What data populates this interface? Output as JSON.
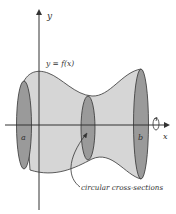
{
  "diagram": {
    "labels": {
      "y_axis": "y",
      "x_axis": "x",
      "curve": "y = f(x)",
      "a": "a",
      "b": "b",
      "annotation": "circular cross-sections"
    },
    "colors": {
      "solid_fill": "#d6d6d6",
      "cross_section_fill": "#9a9a9a",
      "stroke": "#333333",
      "background": "#ffffff"
    }
  }
}
